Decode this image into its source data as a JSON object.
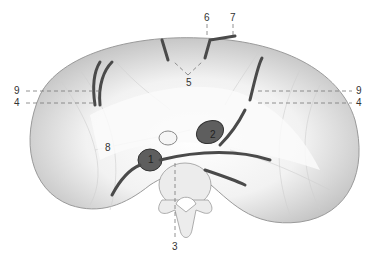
{
  "figure": {
    "labels": [
      {
        "id": "l6",
        "text": "6",
        "x": 204,
        "y": 13
      },
      {
        "id": "l7",
        "text": "7",
        "x": 230,
        "y": 13
      },
      {
        "id": "l5",
        "text": "5",
        "x": 186,
        "y": 78
      },
      {
        "id": "l9a",
        "text": "9",
        "x": 14,
        "y": 87
      },
      {
        "id": "l4a",
        "text": "4",
        "x": 14,
        "y": 99
      },
      {
        "id": "l9b",
        "text": "9",
        "x": 356,
        "y": 87
      },
      {
        "id": "l4b",
        "text": "4",
        "x": 356,
        "y": 99
      },
      {
        "id": "l8",
        "text": "8",
        "x": 105,
        "y": 143
      },
      {
        "id": "l3",
        "text": "3",
        "x": 172,
        "y": 242
      },
      {
        "id": "l1",
        "text": "1",
        "x": 151,
        "y": 161
      },
      {
        "id": "l2",
        "text": "2",
        "x": 213,
        "y": 137
      }
    ],
    "colors": {
      "muscle": "#e6e6e6",
      "muscle_shade": "#bdbdbd",
      "tendon": "#ffffff",
      "vessel": "#555555",
      "vessel_dark": "#3a3a3a",
      "bone": "#ececec",
      "leader": "#777777"
    }
  }
}
